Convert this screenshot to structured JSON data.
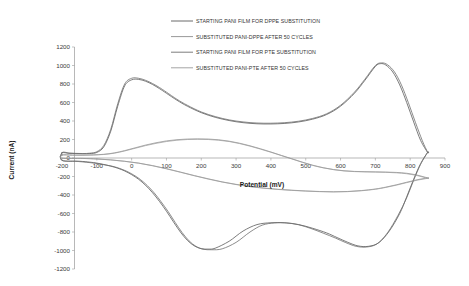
{
  "chart_data": {
    "type": "line",
    "title": "",
    "xlabel": "Potential (mV)",
    "ylabel": "Current (nA)",
    "xlim": [
      -200,
      900
    ],
    "ylim": [
      -1200,
      1200
    ],
    "xticks": [
      -200,
      -100,
      0,
      100,
      200,
      300,
      400,
      500,
      600,
      700,
      800,
      900
    ],
    "xtick_labels": [
      "-200",
      "-100",
      "0",
      "100",
      "200",
      "300",
      "400",
      "500",
      "600",
      "700",
      "800",
      "900"
    ],
    "yticks": [
      1200,
      1000,
      800,
      600,
      400,
      200,
      0,
      -200,
      -400,
      -600,
      -800,
      -1000,
      -1200
    ],
    "ytick_labels": [
      "1200",
      "1000",
      "800",
      "600",
      "400",
      "200",
      "0",
      "-200",
      "-400",
      "-600",
      "-800",
      "-1000",
      "-1200"
    ],
    "grid": false,
    "legend_position": "top-center",
    "series": [
      {
        "name": "STARTING PANI FILM FOR DPPE SUBSTITUTION",
        "color": "#5a5a5a",
        "width": 0.8,
        "x": [
          -200,
          -180,
          -160,
          -140,
          -120,
          -100,
          -80,
          -60,
          -40,
          -20,
          0,
          20,
          40,
          60,
          80,
          100,
          130,
          160,
          200,
          240,
          280,
          320,
          360,
          400,
          440,
          480,
          520,
          560,
          600,
          640,
          670,
          700,
          715,
          730,
          750,
          770,
          790,
          810,
          830,
          850,
          850,
          830,
          810,
          790,
          770,
          740,
          710,
          680,
          650,
          620,
          590,
          560,
          520,
          480,
          440,
          400,
          360,
          320,
          280,
          240,
          220,
          200,
          180,
          160,
          140,
          120,
          100,
          80,
          60,
          40,
          20,
          0,
          -20,
          -40,
          -60,
          -80,
          -100,
          -120,
          -150,
          -200
        ],
        "y": [
          55,
          50,
          48,
          46,
          48,
          60,
          120,
          290,
          560,
          780,
          845,
          850,
          830,
          795,
          750,
          700,
          625,
          560,
          490,
          440,
          405,
          382,
          370,
          368,
          374,
          390,
          420,
          470,
          560,
          700,
          840,
          990,
          1020,
          1005,
          930,
          790,
          600,
          390,
          190,
          60,
          60,
          -60,
          -230,
          -420,
          -600,
          -790,
          -915,
          -955,
          -950,
          -910,
          -860,
          -810,
          -760,
          -720,
          -700,
          -700,
          -720,
          -790,
          -900,
          -975,
          -985,
          -980,
          -950,
          -890,
          -800,
          -690,
          -575,
          -470,
          -375,
          -295,
          -230,
          -180,
          -140,
          -110,
          -88,
          -70,
          -55,
          -45,
          -35,
          -25
        ]
      },
      {
        "name": "SUBSTITUTED PANI-DPPE AFTER 50 CYCLES",
        "color": "#8c8c8c",
        "width": 0.7,
        "x": [
          -200,
          -170,
          -140,
          -110,
          -80,
          -50,
          -20,
          10,
          40,
          70,
          100,
          130,
          160,
          190,
          220,
          250,
          280,
          310,
          340,
          370,
          400,
          430,
          460,
          490,
          520,
          550,
          580,
          610,
          640,
          670,
          700,
          730,
          760,
          790,
          820,
          850,
          850,
          820,
          790,
          760,
          730,
          700,
          660,
          620,
          580,
          540,
          500,
          460,
          420,
          380,
          340,
          300,
          260,
          220,
          180,
          140,
          100,
          60,
          20,
          -20,
          -60,
          -100,
          -140,
          -200
        ],
        "y": [
          35,
          33,
          32,
          34,
          40,
          55,
          80,
          110,
          140,
          165,
          185,
          198,
          205,
          207,
          205,
          197,
          182,
          160,
          132,
          100,
          65,
          28,
          -8,
          -45,
          -78,
          -105,
          -125,
          -138,
          -145,
          -148,
          -150,
          -152,
          -156,
          -165,
          -185,
          -215,
          -215,
          -235,
          -262,
          -290,
          -315,
          -335,
          -352,
          -362,
          -365,
          -362,
          -356,
          -348,
          -338,
          -325,
          -308,
          -285,
          -258,
          -225,
          -190,
          -152,
          -115,
          -82,
          -55,
          -35,
          -20,
          -10,
          -5,
          -2
        ]
      },
      {
        "name": "STARTING PANI FILM FOR PTE SUBSTITUTION",
        "color": "#6e6e6e",
        "width": 0.8,
        "x": [
          -200,
          -180,
          -160,
          -140,
          -120,
          -100,
          -80,
          -60,
          -40,
          -20,
          0,
          20,
          40,
          60,
          80,
          100,
          130,
          160,
          200,
          240,
          280,
          320,
          360,
          400,
          440,
          480,
          520,
          560,
          600,
          640,
          670,
          700,
          718,
          735,
          755,
          775,
          795,
          815,
          835,
          850,
          850,
          830,
          810,
          790,
          765,
          735,
          705,
          675,
          645,
          615,
          585,
          550,
          515,
          480,
          445,
          410,
          375,
          340,
          300,
          260,
          230,
          205,
          185,
          165,
          145,
          125,
          105,
          85,
          65,
          45,
          25,
          5,
          -15,
          -35,
          -55,
          -80,
          -105,
          -130,
          -160,
          -200
        ],
        "y": [
          60,
          54,
          50,
          48,
          52,
          68,
          135,
          310,
          585,
          800,
          862,
          862,
          840,
          805,
          762,
          712,
          635,
          570,
          498,
          448,
          412,
          390,
          378,
          376,
          382,
          398,
          428,
          478,
          570,
          712,
          852,
          1000,
          1028,
          1008,
          930,
          788,
          596,
          386,
          186,
          62,
          62,
          -68,
          -240,
          -430,
          -620,
          -808,
          -928,
          -962,
          -955,
          -915,
          -865,
          -812,
          -762,
          -722,
          -702,
          -702,
          -726,
          -800,
          -912,
          -982,
          -992,
          -986,
          -956,
          -896,
          -806,
          -696,
          -580,
          -475,
          -378,
          -298,
          -232,
          -182,
          -142,
          -112,
          -90,
          -72,
          -57,
          -46,
          -36,
          -26
        ]
      },
      {
        "name": "SUBSTITUTED PANI-PTE AFTER 50 CYCLES",
        "color": "#9a9a9a",
        "width": 0.7,
        "x": [
          -200,
          -170,
          -140,
          -110,
          -80,
          -50,
          -20,
          10,
          40,
          70,
          100,
          130,
          160,
          190,
          220,
          250,
          280,
          310,
          340,
          370,
          400,
          430,
          460,
          490,
          520,
          550,
          580,
          610,
          640,
          670,
          700,
          730,
          760,
          790,
          820,
          850,
          850,
          820,
          790,
          760,
          730,
          700,
          660,
          620,
          580,
          540,
          500,
          460,
          420,
          380,
          340,
          300,
          260,
          220,
          180,
          140,
          100,
          60,
          20,
          -20,
          -60,
          -100,
          -140,
          -200
        ],
        "y": [
          30,
          29,
          29,
          32,
          38,
          52,
          76,
          105,
          134,
          158,
          178,
          192,
          200,
          202,
          200,
          192,
          178,
          156,
          128,
          96,
          62,
          26,
          -10,
          -46,
          -80,
          -106,
          -126,
          -140,
          -147,
          -150,
          -152,
          -155,
          -160,
          -170,
          -190,
          -220,
          -220,
          -240,
          -266,
          -294,
          -318,
          -338,
          -354,
          -364,
          -367,
          -364,
          -358,
          -350,
          -340,
          -327,
          -310,
          -287,
          -260,
          -228,
          -192,
          -154,
          -117,
          -84,
          -56,
          -36,
          -21,
          -11,
          -5,
          -2
        ]
      }
    ],
    "annotations": {
      "anodic_peak_1": {
        "x": 10,
        "y": 855,
        "label": "first oxidation peak"
      },
      "anodic_peak_2": {
        "x": 715,
        "y": 1025,
        "label": "second oxidation peak"
      },
      "cathodic_peak_1": {
        "x": 205,
        "y": -990,
        "label": "first reduction peak"
      },
      "cathodic_peak_2": {
        "x": 660,
        "y": -960,
        "label": "second reduction peak"
      }
    }
  },
  "legend": {
    "items": [
      {
        "label": "STARTING PANI FILM FOR DPPE SUBSTITUTION",
        "color": "#5a5a5a"
      },
      {
        "label": "SUBSTITUTED PANI-DPPE AFTER 50 CYCLES",
        "color": "#8c8c8c"
      },
      {
        "label": "STARTING PANI FILM FOR PTE SUBSTITUTION",
        "color": "#6e6e6e"
      },
      {
        "label": "SUBSTITUTED PANI-PTE AFTER 50 CYCLES",
        "color": "#9a9a9a"
      }
    ]
  }
}
